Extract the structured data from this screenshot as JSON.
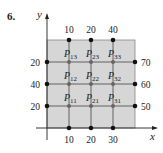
{
  "problem_number": "6.",
  "axes": {
    "x_label": "x",
    "y_label": "y"
  },
  "boundary": {
    "top": [
      "10",
      "20",
      "40"
    ],
    "bottom": [
      "10",
      "20",
      "30"
    ],
    "left": [
      "20",
      "40",
      "20"
    ],
    "right": [
      "70",
      "60",
      "50"
    ]
  },
  "interior_points": [
    [
      "P",
      "13"
    ],
    [
      "P",
      "23"
    ],
    [
      "P",
      "33"
    ],
    [
      "P",
      "12"
    ],
    [
      "P",
      "22"
    ],
    [
      "P",
      "32"
    ],
    [
      "P",
      "11"
    ],
    [
      "P",
      "21"
    ],
    [
      "P",
      "31"
    ]
  ],
  "colors": {
    "plate_fill": "#d6d6d6",
    "grid_line": "#555555",
    "node": "#111111",
    "interior_node": "#666666"
  }
}
